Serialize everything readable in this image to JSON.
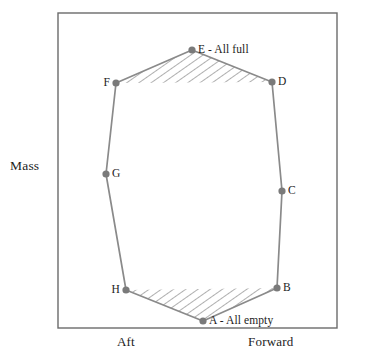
{
  "figure": {
    "frame": {
      "x": 58,
      "y": 13,
      "width": 279,
      "height": 315,
      "stroke": "#6b6b6b"
    },
    "background": "#ffffff",
    "line_color": "#8a8a8a",
    "marker_color": "#7a7a7a",
    "hatch_color": "#9a9a9a",
    "text_color": "#1c1c1c"
  },
  "axes": {
    "y_label": "Mass",
    "x_label_left": "Aft",
    "x_label_right": "Forward"
  },
  "chart_data": {
    "type": "line",
    "title": "",
    "xlabel": "Forward / Aft (Center of Gravity)",
    "ylabel": "Mass",
    "grid": false,
    "legend": "none",
    "points": [
      {
        "id": "A",
        "label": "A - All empty",
        "x": 203,
        "y": 321,
        "label_side": "right"
      },
      {
        "id": "B",
        "label": "B",
        "x": 277,
        "y": 288,
        "label_side": "right"
      },
      {
        "id": "C",
        "label": "C",
        "x": 282,
        "y": 191,
        "label_side": "right"
      },
      {
        "id": "D",
        "label": "D",
        "x": 272,
        "y": 82,
        "label_side": "right"
      },
      {
        "id": "E",
        "label": "E - All full",
        "x": 192,
        "y": 50,
        "label_side": "right"
      },
      {
        "id": "F",
        "label": "F",
        "x": 116,
        "y": 83,
        "label_side": "left"
      },
      {
        "id": "G",
        "label": "G",
        "x": 106,
        "y": 174,
        "label_side": "right"
      },
      {
        "id": "H",
        "label": "H",
        "x": 126,
        "y": 290,
        "label_side": "left"
      }
    ],
    "envelope_path": "M 203 321 L 277 288 L 282 191 L 272 82 L 192 50 L 116 83 L 106 174 L 126 290 Z",
    "hatched_regions": [
      {
        "name": "top-fuel-triangle",
        "path": "M 116 83 L 192 50 L 272 82 Z"
      },
      {
        "name": "bottom-fuel-triangle",
        "path": "M 126 290 L 277 288 L 203 321 Z"
      }
    ]
  }
}
